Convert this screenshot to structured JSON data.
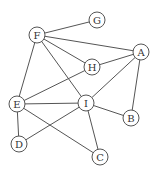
{
  "graph": {
    "nodes": [
      {
        "id": "F",
        "label": "F",
        "x": 37,
        "y": 35
      },
      {
        "id": "G",
        "label": "G",
        "x": 97,
        "y": 20
      },
      {
        "id": "A",
        "label": "A",
        "x": 141,
        "y": 52
      },
      {
        "id": "H",
        "label": "H",
        "x": 92,
        "y": 67
      },
      {
        "id": "E",
        "label": "E",
        "x": 17,
        "y": 104
      },
      {
        "id": "I",
        "label": "I",
        "x": 86,
        "y": 103
      },
      {
        "id": "B",
        "label": "B",
        "x": 131,
        "y": 118
      },
      {
        "id": "D",
        "label": "D",
        "x": 19,
        "y": 144
      },
      {
        "id": "C",
        "label": "C",
        "x": 100,
        "y": 157
      }
    ],
    "edges": [
      [
        "F",
        "G"
      ],
      [
        "F",
        "A"
      ],
      [
        "F",
        "H"
      ],
      [
        "F",
        "I"
      ],
      [
        "F",
        "E"
      ],
      [
        "H",
        "A"
      ],
      [
        "H",
        "E"
      ],
      [
        "A",
        "I"
      ],
      [
        "A",
        "B"
      ],
      [
        "E",
        "I"
      ],
      [
        "E",
        "D"
      ],
      [
        "E",
        "C"
      ],
      [
        "I",
        "B"
      ],
      [
        "I",
        "D"
      ],
      [
        "I",
        "C"
      ]
    ],
    "node_radius": 8
  }
}
